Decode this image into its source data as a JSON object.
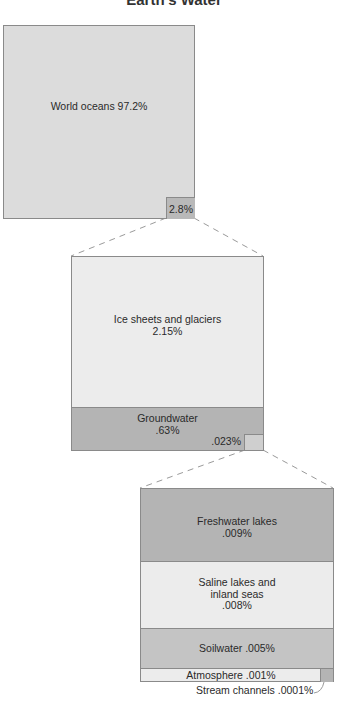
{
  "title": "Earth's Water",
  "colors": {
    "light_fill": "#dcdcdc",
    "lighter_fill": "#ececec",
    "dark_fill": "#b4b4b4",
    "border": "#8a8a8a",
    "dash": "#9a9a9a"
  },
  "level1": {
    "main": {
      "label": "World oceans 97.2%",
      "value": 97.2
    },
    "inset": {
      "label": "2.8%",
      "value": 2.8
    }
  },
  "level2": {
    "segments": [
      {
        "name": "Ice sheets and glaciers",
        "line1": "Ice sheets and glaciers",
        "line2": "2.15%",
        "value": 2.15
      },
      {
        "name": "Groundwater",
        "line1": "Groundwater",
        "line2": ".63%",
        "value": 0.63
      }
    ],
    "inset": {
      "label": ".023%",
      "value": 0.023
    }
  },
  "level3": {
    "segments": [
      {
        "name": "Freshwater lakes",
        "line1": "Freshwater lakes",
        "line2": ".009%",
        "value": 0.009
      },
      {
        "name": "Saline lakes and inland seas",
        "line1": "Saline lakes and",
        "line2": "inland seas",
        "line3": ".008%",
        "value": 0.008
      },
      {
        "name": "Soilwater",
        "line1": "Soilwater .005%",
        "value": 0.005
      },
      {
        "name": "Atmosphere",
        "line1": "Atmosphere .001%",
        "value": 0.001
      }
    ],
    "stream": {
      "label": "Stream channels .0001%",
      "value": 0.0001
    }
  }
}
